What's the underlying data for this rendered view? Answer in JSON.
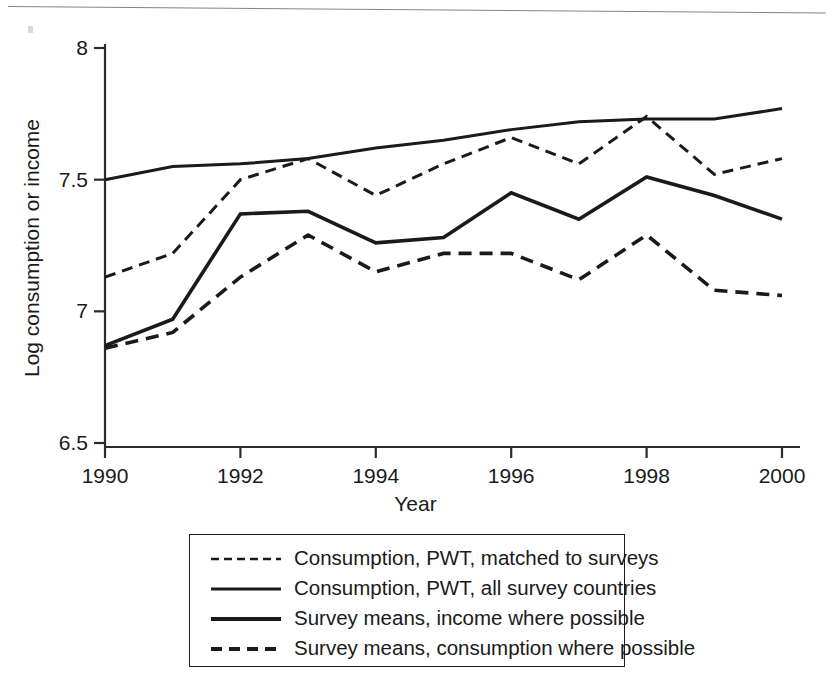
{
  "chart_data": {
    "type": "line",
    "title": "",
    "xlabel": "Year",
    "ylabel": "Log consumption or income",
    "xlim": [
      1990,
      2000
    ],
    "ylim": [
      6.5,
      8.0
    ],
    "xticks": [
      1990,
      1992,
      1994,
      1996,
      1998,
      2000
    ],
    "xtick_labels": [
      "1990",
      "1992",
      "1994",
      "1996",
      "1998",
      "2000"
    ],
    "yticks": [
      6.5,
      7,
      7.5,
      8
    ],
    "ytick_labels": [
      "6.5",
      "7",
      "7.5",
      "8"
    ],
    "grid": false,
    "legend_position": "below-plot",
    "x": [
      1990,
      1991,
      1992,
      1993,
      1994,
      1995,
      1996,
      1997,
      1998,
      1999,
      2000
    ],
    "series": [
      {
        "name": "Consumption, PWT, matched to surveys",
        "style": "dashed",
        "values": [
          7.13,
          7.22,
          7.5,
          7.58,
          7.44,
          7.56,
          7.66,
          7.56,
          7.74,
          7.52,
          7.58
        ]
      },
      {
        "name": "Consumption, PWT, all survey countries",
        "style": "solid-thin",
        "values": [
          7.5,
          7.55,
          7.56,
          7.58,
          7.62,
          7.65,
          7.69,
          7.72,
          7.73,
          7.73,
          7.77
        ]
      },
      {
        "name": "Survey means, income where possible",
        "style": "solid-thick",
        "values": [
          6.87,
          6.97,
          7.37,
          7.38,
          7.26,
          7.28,
          7.45,
          7.35,
          7.51,
          7.44,
          7.35
        ]
      },
      {
        "name": "Survey means, consumption where possible",
        "style": "dashed-thick",
        "values": [
          6.86,
          6.92,
          7.13,
          7.29,
          7.15,
          7.22,
          7.22,
          7.12,
          7.29,
          7.08,
          7.06
        ]
      }
    ]
  },
  "axes": {
    "ylabel": "Log consumption or income",
    "xlabel": "Year",
    "ytick_labels": [
      "8",
      "7.5",
      "7",
      "6.5"
    ],
    "xtick_labels": [
      "1990",
      "1992",
      "1994",
      "1996",
      "1998",
      "2000"
    ]
  },
  "legend": {
    "items": [
      {
        "label": "Consumption, PWT, matched to surveys",
        "sample": "dashed-line-sample"
      },
      {
        "label": "Consumption, PWT, all survey countries",
        "sample": "solid-line-sample"
      },
      {
        "label": "Survey means, income where possible",
        "sample": "solid-line-sample"
      },
      {
        "label": "Survey means, consumption where possible",
        "sample": "dashed-line-sample"
      }
    ]
  },
  "colors": {
    "line": "#1a1a1a",
    "axis": "#2b2b2b",
    "background": "#ffffff"
  }
}
